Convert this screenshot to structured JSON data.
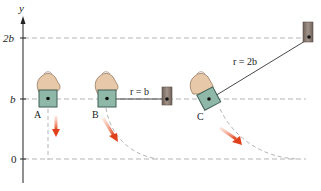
{
  "axis": {
    "label": "y",
    "ticks": [
      {
        "label": "2b",
        "value": "2b"
      },
      {
        "label": "b",
        "value": "b"
      },
      {
        "label": "0",
        "value": "0"
      }
    ]
  },
  "cases": [
    {
      "label": "A",
      "description": "block released from hand, falls straight down"
    },
    {
      "label": "B",
      "rope_label": "r = b",
      "description": "block attached to rope of length b, swings in arc"
    },
    {
      "label": "C",
      "rope_label": "r = 2b",
      "description": "block attached to rope of length 2b, swings in arc"
    }
  ],
  "colors": {
    "block": "#8fb8a8",
    "block_border": "#3f5f55",
    "peg": "#8a7a6e",
    "arrow": "#e2542a",
    "guide": "#b5b5b5",
    "hand": "#e7c8a8"
  }
}
